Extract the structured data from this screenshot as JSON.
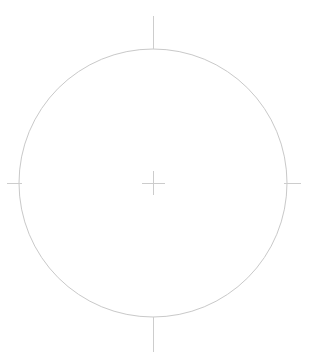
{
  "document": {
    "title": "Circle Drawing",
    "canvas_width": 313,
    "canvas_height": 361,
    "background_color": "#ffffff"
  },
  "style": {
    "circle_stroke_color": "#c9c9c9",
    "axis_stroke_color": "#cdcdcd",
    "center_mark_stroke_color": "#cccccc",
    "stroke_width": 1
  },
  "geometry": {
    "circle": {
      "label": "circle",
      "center_x": 153,
      "center_y": 183,
      "radius": 134,
      "diameter": 268
    },
    "center_mark": {
      "label": "center-mark",
      "horizontal": {
        "x1": 142,
        "y1": 183,
        "x2": 165,
        "y2": 183
      },
      "vertical": {
        "x1": 153,
        "y1": 171,
        "x2": 153,
        "y2": 195
      }
    },
    "axis_ticks": [
      {
        "label": "top-axis-tick",
        "direction": "north",
        "x1": 153,
        "y1": 16,
        "x2": 153,
        "y2": 49
      },
      {
        "label": "bottom-axis-tick",
        "direction": "south",
        "x1": 153,
        "y1": 317,
        "x2": 153,
        "y2": 352
      },
      {
        "label": "left-axis-tick",
        "direction": "west",
        "x1": 7,
        "y1": 183,
        "x2": 22,
        "y2": 183
      },
      {
        "label": "right-axis-tick",
        "direction": "east",
        "x1": 284,
        "y1": 183,
        "x2": 301,
        "y2": 183
      }
    ]
  }
}
